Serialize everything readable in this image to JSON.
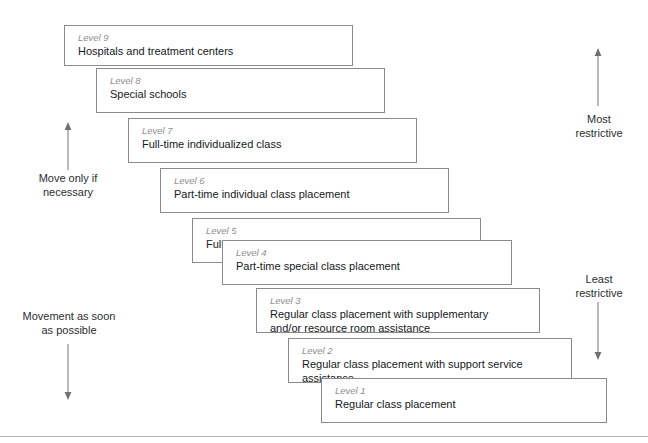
{
  "figure": {
    "kind": "cascade-of-services-diagram",
    "bottom_rule_y": 436
  },
  "steps": [
    {
      "level_label": "Level 9",
      "text": "Hospitals and treatment centers",
      "x": 64,
      "y": 25,
      "w": 289,
      "h": 41
    },
    {
      "level_label": "Level 8",
      "text": "Special schools",
      "x": 96,
      "y": 68,
      "w": 289,
      "h": 45
    },
    {
      "level_label": "Level 7",
      "text": "Full-time individualized class",
      "x": 128,
      "y": 118,
      "w": 289,
      "h": 45
    },
    {
      "level_label": "Level 6",
      "text": "Part-time individual class placement",
      "x": 160,
      "y": 168,
      "w": 289,
      "h": 45
    },
    {
      "level_label": "Level 5",
      "text": "Full-time special class",
      "x": 192,
      "y": 218,
      "w": 289,
      "h": 45
    },
    {
      "level_label": "Level 4",
      "text": "Part-time special class placement",
      "x": 222,
      "y": 240,
      "w": 290,
      "h": 45
    },
    {
      "level_label": "Level 3",
      "text": "Regular class placement with supplementary\nand/or resource room assistance",
      "x": 256,
      "y": 288,
      "w": 284,
      "h": 45
    },
    {
      "level_label": "Level 2",
      "text": "Regular class placement with support service\nassistance",
      "x": 288,
      "y": 338,
      "w": 284,
      "h": 45
    },
    {
      "level_label": "Level 1",
      "text": "Regular class placement",
      "x": 321,
      "y": 378,
      "w": 286,
      "h": 45
    }
  ],
  "annotations": {
    "left_top": {
      "text": "Move only if\nnecessary",
      "x": 16,
      "y": 172,
      "w": 104
    },
    "left_bottom": {
      "text": "Movement as soon\nas possible",
      "x": 13,
      "y": 310,
      "w": 112
    },
    "right_top": {
      "text": "Most\nrestrictive",
      "x": 562,
      "y": 113,
      "w": 74
    },
    "right_bottom": {
      "text": "Least\nrestrictive",
      "x": 562,
      "y": 273,
      "w": 74
    }
  },
  "arrows": [
    {
      "name": "move-up-arrow",
      "x": 68,
      "y": 122,
      "length": 48,
      "direction": "up"
    },
    {
      "name": "move-down-arrow",
      "x": 68,
      "y": 344,
      "length": 56,
      "direction": "down"
    },
    {
      "name": "most-restrictive-arrow",
      "x": 598,
      "y": 48,
      "length": 58,
      "direction": "up"
    },
    {
      "name": "least-restrictive-arrow",
      "x": 598,
      "y": 302,
      "length": 58,
      "direction": "down"
    }
  ],
  "colors": {
    "box_border": "#8a8a8a",
    "level_label": "#8e8e8e",
    "body_text": "#15191c",
    "arrow": "#6e7275",
    "rule": "#b4b4b4"
  }
}
